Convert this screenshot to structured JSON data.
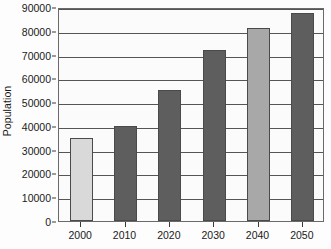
{
  "chart_data": {
    "type": "bar",
    "title": "",
    "xlabel": "",
    "ylabel": "Population",
    "categories": [
      "2000",
      "2010",
      "2020",
      "2030",
      "2040",
      "2050"
    ],
    "values": [
      35000,
      40000,
      55000,
      72000,
      81000,
      87500
    ],
    "ylim": [
      0,
      90000
    ],
    "yticks": [
      0,
      10000,
      20000,
      30000,
      40000,
      50000,
      60000,
      70000,
      80000,
      90000
    ],
    "ytick_labels": [
      "0",
      "10000",
      "20000",
      "30000",
      "40000",
      "50000",
      "60000",
      "70000",
      "80000",
      "90000"
    ],
    "grid": true,
    "legend": "none",
    "bar_colors": [
      "#d9d9d9",
      "#5e5e5e",
      "#5e5e5e",
      "#5e5e5e",
      "#a8a8a8",
      "#5e5e5e"
    ],
    "colors": {
      "plot_background": "#fbfbfb",
      "page_background": "#fdfdfd",
      "gridline": "#555555",
      "axis": "#6a6a6a",
      "text": "#1a1a1a",
      "bar_light": "#d9d9d9",
      "bar_medium": "#a8a8a8",
      "bar_dark": "#5e5e5e"
    }
  }
}
